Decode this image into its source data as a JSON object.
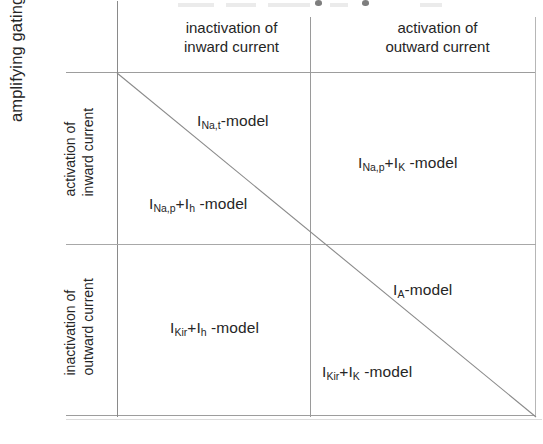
{
  "figure": {
    "axis_caption": "amplifying gating variables",
    "columns": [
      {
        "line1": "inactivation of",
        "line2": "inward current"
      },
      {
        "line1": "activation of",
        "line2": "outward current"
      }
    ],
    "rows": [
      {
        "line1": "activation of",
        "line2": "inward current"
      },
      {
        "line1": "inactivation of",
        "line2": "outward current"
      }
    ],
    "cells": [
      {
        "id": "cell-na-t",
        "prefix": "I",
        "sub1": "Na,t",
        "mid": "",
        "sub2": "",
        "suffix": "-model",
        "text": "INa,t-model"
      },
      {
        "id": "cell-na-p-k",
        "prefix": "I",
        "sub1": "Na,p",
        "mid": "+I",
        "sub2": "K",
        "suffix": " -model",
        "text": "INa,p+IK -model"
      },
      {
        "id": "cell-na-p-h",
        "prefix": "I",
        "sub1": "Na,p",
        "mid": "+I",
        "sub2": "h",
        "suffix": " -model",
        "text": "INa,p+Ih -model"
      },
      {
        "id": "cell-kir-h",
        "prefix": "I",
        "sub1": "Kir",
        "mid": "+I",
        "sub2": "h",
        "suffix": " -model",
        "text": "IKir+Ih -model"
      },
      {
        "id": "cell-a",
        "prefix": "I",
        "sub1": "A",
        "mid": "",
        "sub2": "",
        "suffix": "-model",
        "text": "IA-model"
      },
      {
        "id": "cell-kir-k",
        "prefix": "I",
        "sub1": "Kir",
        "mid": "+I",
        "sub2": "K",
        "suffix": " -model",
        "text": "IKir+IK -model"
      }
    ],
    "colors": {
      "ink": "#262626",
      "rule": "#9d9d9d",
      "diagonal": "#8a8a8a",
      "background": "#ffffff"
    }
  }
}
